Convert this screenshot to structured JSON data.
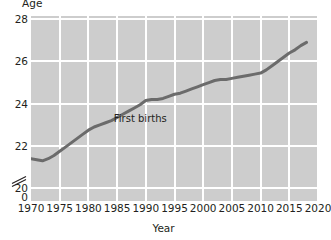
{
  "chart_data": {
    "type": "line",
    "title": "",
    "xlabel": "Year",
    "ylabel": "Age",
    "xlim": [
      1970,
      2020
    ],
    "ylim": [
      19.4,
      28.15
    ],
    "y_axis_break": true,
    "y_break_label": "0",
    "grid": true,
    "legend": "none",
    "xticks": [
      "1970",
      "1975",
      "1980",
      "1985",
      "1990",
      "1995",
      "2000",
      "2005",
      "2010",
      "2015",
      "2020"
    ],
    "xtick_values": [
      1970,
      1975,
      1980,
      1985,
      1990,
      1995,
      2000,
      2005,
      2010,
      2015,
      2020
    ],
    "yticks": [
      "0",
      "20",
      "22",
      "24",
      "26",
      "28"
    ],
    "ytick_values": [
      19.55,
      20,
      22,
      24,
      26,
      28
    ],
    "series": [
      {
        "name": "First births",
        "color": "#6b6b6b",
        "annotation": "First births",
        "annotation_x": 1990,
        "annotation_y": 23.3,
        "x": [
          1970,
          1971,
          1972,
          1973,
          1974,
          1975,
          1976,
          1977,
          1978,
          1979,
          1980,
          1981,
          1982,
          1983,
          1984,
          1985,
          1986,
          1987,
          1988,
          1989,
          1990,
          1991,
          1992,
          1993,
          1994,
          1995,
          1996,
          1997,
          1998,
          1999,
          2000,
          2001,
          2002,
          2003,
          2004,
          2005,
          2006,
          2007,
          2008,
          2009,
          2010,
          2011,
          2012,
          2013,
          2014,
          2015,
          2016,
          2017,
          2018
        ],
        "values": [
          21.4,
          21.35,
          21.3,
          21.4,
          21.55,
          21.75,
          21.95,
          22.15,
          22.35,
          22.55,
          22.75,
          22.9,
          23.0,
          23.1,
          23.2,
          23.35,
          23.5,
          23.65,
          23.8,
          23.95,
          24.15,
          24.2,
          24.2,
          24.25,
          24.35,
          24.45,
          24.5,
          24.6,
          24.7,
          24.8,
          24.9,
          25.0,
          25.1,
          25.15,
          25.15,
          25.2,
          25.25,
          25.3,
          25.35,
          25.4,
          25.45,
          25.6,
          25.8,
          26.0,
          26.2,
          26.4,
          26.55,
          26.75,
          26.9
        ]
      }
    ]
  },
  "labels": {
    "y_axis_title": "Age",
    "x_axis_title": "Year",
    "annotation_first_births": "First births"
  },
  "colors": {
    "plot_background": "#cdcdcd",
    "gridline": "#ffffff",
    "line": "#6b6b6b",
    "text": "#231f20",
    "page_background": "#ffffff"
  }
}
